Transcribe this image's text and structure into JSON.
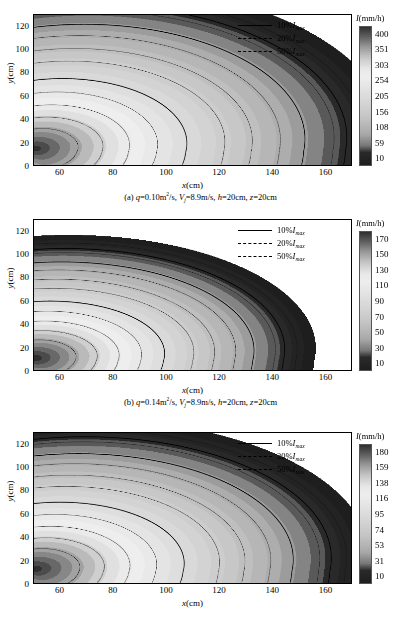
{
  "figure": {
    "type": "contour-plot-figure",
    "panel_count": 3
  },
  "chart_data": [
    {
      "type": "heatmap",
      "panel": "a",
      "title": "",
      "caption": "(a) q=0.10m2/s, Vj=8.9m/s, h=20cm, z=20cm",
      "xlabel": "x",
      "xunit": "(cm)",
      "ylabel": "y",
      "yunit": "(cm)",
      "xlim": [
        50,
        170
      ],
      "ylim": [
        0,
        130
      ],
      "xticks": [
        60,
        80,
        100,
        120,
        140,
        160
      ],
      "yticks": [
        0,
        20,
        40,
        60,
        80,
        100,
        120
      ],
      "grid": false,
      "colorbar": {
        "label": "I(mm/h)",
        "symbol": "I",
        "unit": "(mm/h)",
        "ticks": [
          400,
          351,
          303,
          254,
          205,
          156,
          108,
          59,
          10
        ],
        "vmin": 10,
        "vmax": 400
      },
      "legend": {
        "position": "top-right",
        "entries": [
          {
            "label": "10%Imax",
            "percent": "10%",
            "style": "solid"
          },
          {
            "label": "20%Imax",
            "percent": "20%",
            "style": "dashdot"
          },
          {
            "label": "50%Imax",
            "percent": "50%",
            "style": "dashed"
          }
        ]
      },
      "contour_levels_pct": [
        10,
        20,
        50
      ],
      "spread_edge_x_at_y0": 160,
      "spread_edge_y_at_xmin": 123
    },
    {
      "type": "heatmap",
      "panel": "b",
      "title": "",
      "caption": "(b) q=0.14m2/s, Vj=8.9m/s, h=20cm, z=20cm",
      "xlabel": "x",
      "xunit": "(cm)",
      "ylabel": "y",
      "yunit": "(cm)",
      "xlim": [
        50,
        170
      ],
      "ylim": [
        0,
        130
      ],
      "xticks": [
        60,
        80,
        100,
        120,
        140,
        160
      ],
      "yticks": [
        0,
        20,
        40,
        60,
        80,
        100,
        120
      ],
      "grid": false,
      "colorbar": {
        "label": "I(mm/h)",
        "symbol": "I",
        "unit": "(mm/h)",
        "ticks": [
          170,
          150,
          130,
          110,
          90,
          70,
          50,
          30,
          10
        ],
        "vmin": 10,
        "vmax": 170
      },
      "legend": {
        "position": "top-right",
        "entries": [
          {
            "label": "10%Imax",
            "percent": "10%",
            "style": "solid"
          },
          {
            "label": "20%Imax",
            "percent": "20%",
            "style": "dashdot"
          },
          {
            "label": "50%Imax",
            "percent": "50%",
            "style": "dashed"
          }
        ]
      },
      "contour_levels_pct": [
        10,
        20,
        50
      ],
      "spread_edge_x_at_y0": 140,
      "spread_edge_y_at_xmin": 122
    },
    {
      "type": "heatmap",
      "panel": "c",
      "title": "",
      "caption": "",
      "xlabel": "x",
      "xunit": "(cm)",
      "ylabel": "y",
      "yunit": "(cm)",
      "xlim": [
        50,
        170
      ],
      "ylim": [
        0,
        130
      ],
      "xticks": [
        60,
        80,
        100,
        120,
        140,
        160
      ],
      "yticks": [
        0,
        20,
        40,
        60,
        80,
        100,
        120
      ],
      "grid": false,
      "colorbar": {
        "label": "I(mm/h)",
        "symbol": "I",
        "unit": "(mm/h)",
        "ticks": [
          180,
          159,
          138,
          116,
          95,
          74,
          53,
          31,
          10
        ],
        "vmin": 10,
        "vmax": 180
      },
      "legend": {
        "position": "top-right",
        "entries": [
          {
            "label": "10%Imax",
            "percent": "10%",
            "style": "solid"
          },
          {
            "label": "20%Imax",
            "percent": "20%",
            "style": "dashdot"
          },
          {
            "label": "50%Imax",
            "percent": "50%",
            "style": "dashed"
          }
        ]
      },
      "contour_levels_pct": [
        10,
        20,
        50
      ],
      "spread_edge_x_at_y0": 155,
      "spread_edge_y_at_xmin": 128
    }
  ],
  "panels": [
    {
      "id": "a",
      "caption_prefix": "(a) ",
      "caption_q": "q",
      "caption_q_val": "=0.10m",
      "caption_q_sup": "2",
      "caption_q_tail": "/s,  ",
      "caption_v": "V",
      "caption_v_sub": "j",
      "caption_v_val": "=8.9m/s,  ",
      "caption_h": "h",
      "caption_h_val": "=20cm,  ",
      "caption_z": "z",
      "caption_z_val": "=20cm"
    },
    {
      "id": "b",
      "caption_prefix": "(b) ",
      "caption_q": "q",
      "caption_q_val": "=0.14m",
      "caption_q_sup": "2",
      "caption_q_tail": "/s,  ",
      "caption_v": "V",
      "caption_v_sub": "j",
      "caption_v_val": "=8.9m/s,  ",
      "caption_h": "h",
      "caption_h_val": "=20cm,  ",
      "caption_z": "z",
      "caption_z_val": "=20cm"
    }
  ],
  "axis_text": {
    "x_symbol": "x",
    "x_unit": "(cm)",
    "y_symbol": "y",
    "y_unit": "(cm)"
  },
  "colorbar_text": {
    "symbol": "I",
    "unit": "(mm/h)"
  },
  "legend_text": {
    "e0_pct": "10%",
    "e0_sym": "I",
    "e0_sub": "max",
    "e1_pct": "20%",
    "e1_sym": "I",
    "e1_sub": "max",
    "e2_pct": "50%",
    "e2_sym": "I",
    "e2_sub": "max"
  }
}
